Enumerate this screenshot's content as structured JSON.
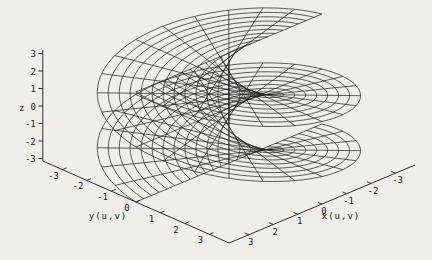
{
  "figure": {
    "background_color": "#efeee9",
    "width": 432,
    "height": 260
  },
  "chart_data": {
    "type": "surface",
    "subtype": "3d-parametric-wireframe",
    "title": "",
    "equations": {
      "x": "u*cos(v)",
      "y": "u*sin(v)",
      "z": "-v"
    },
    "u_range": [
      -3.8,
      3.8
    ],
    "v_range": [
      -3.1416,
      3.1416
    ],
    "iso_lines": {
      "u": 25,
      "v": 25
    },
    "curve_samples": 140,
    "xlabel": "x(u,v)",
    "ylabel": "y(u,v)",
    "zlabel": "z",
    "x_ticks": [
      3,
      2,
      1,
      0,
      -1,
      -2,
      -3
    ],
    "y_ticks": [
      -3,
      -2,
      -1,
      0,
      1,
      2,
      3
    ],
    "z_ticks": [
      3,
      2,
      1,
      0,
      -1,
      -2,
      -3
    ],
    "grid": false,
    "legend": false,
    "line_color": "#1f1f1f",
    "axis_color": "#1b1b1b",
    "tick_label_color": "#1b1b1b",
    "view": {
      "projection": "orthographic",
      "origin": [
        228.9,
        108
      ],
      "ex": [
        -24.47,
        10.26
      ],
      "ey": [
        24.51,
        10.79
      ],
      "ez": [
        0,
        -17.5
      ],
      "axis_margin": 3.8,
      "z_base": -3.1416,
      "z_top": 3.2
    }
  }
}
